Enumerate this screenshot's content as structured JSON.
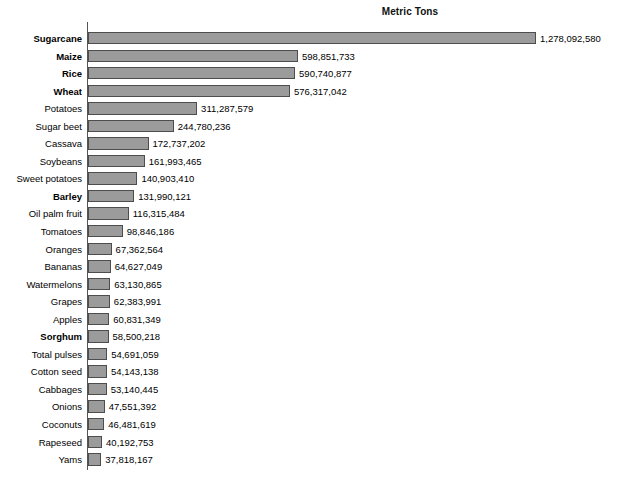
{
  "chart": {
    "title": "Metric Tons"
  },
  "chart_data": {
    "type": "bar",
    "orientation": "horizontal",
    "title": "Metric Tons",
    "xlabel": "",
    "ylabel": "",
    "xlim": [
      0,
      1278092580
    ],
    "grid": false,
    "legend": false,
    "value_labels": true,
    "bar_color": "#9b9b9b",
    "bar_border_color": "#4d4d4d",
    "axis_color": "#555555",
    "categories": [
      "Sugarcane",
      "Maize",
      "Rice",
      "Wheat",
      "Potatoes",
      "Sugar beet",
      "Cassava",
      "Soybeans",
      "Sweet potatoes",
      "Barley",
      "Oil palm fruit",
      "Tomatoes",
      "Oranges",
      "Bananas",
      "Watermelons",
      "Grapes",
      "Apples",
      "Sorghum",
      "Total pulses",
      "Cotton seed",
      "Cabbages",
      "Onions",
      "Coconuts",
      "Rapeseed",
      "Yams"
    ],
    "values": [
      1278092580,
      598851733,
      590740877,
      576317042,
      311287579,
      244780236,
      172737202,
      161993465,
      140903410,
      131990121,
      116315484,
      98846186,
      67362564,
      64627049,
      63130865,
      62383991,
      60831349,
      58500218,
      54691059,
      54143138,
      53140445,
      47551392,
      46481619,
      40192753,
      37818167
    ],
    "value_labels_text": [
      "1,278,092,580",
      "598,851,733",
      "590,740,877",
      "576,317,042",
      "311,287,579",
      "244,780,236",
      "172,737,202",
      "161,993,465",
      "140,903,410",
      "131,990,121",
      "116,315,484",
      "98,846,186",
      "67,362,564",
      "64,627,049",
      "63,130,865",
      "62,383,991",
      "60,831,349",
      "58,500,218",
      "54,691,059",
      "54,143,138",
      "53,140,445",
      "47,551,392",
      "46,481,619",
      "40,192,753",
      "37,818,167"
    ],
    "bold_categories": [
      "Sugarcane",
      "Maize",
      "Rice",
      "Wheat",
      "Barley",
      "Sorghum"
    ]
  }
}
